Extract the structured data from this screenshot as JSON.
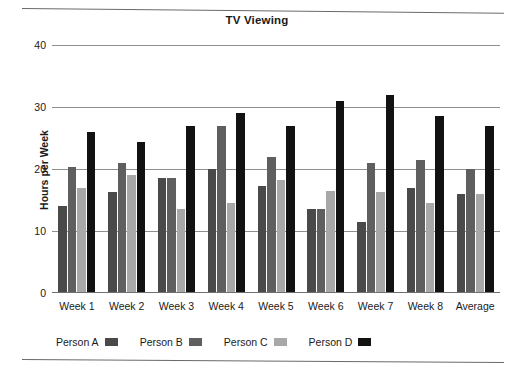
{
  "chart_data": {
    "type": "bar",
    "title": "TV Viewing",
    "xlabel": "",
    "ylabel": "Hours per Week",
    "ylim": [
      0,
      40
    ],
    "yticks": [
      0,
      10,
      20,
      30,
      40
    ],
    "grid": true,
    "legend_position": "bottom",
    "categories": [
      "Week 1",
      "Week 2",
      "Week 3",
      "Week 4",
      "Week 5",
      "Week 6",
      "Week 7",
      "Week 8",
      "Average"
    ],
    "series": [
      {
        "name": "Person A",
        "color": "#4a4a4a",
        "values": [
          14,
          16.3,
          18.5,
          20,
          17.3,
          13.5,
          11.5,
          17,
          16
        ]
      },
      {
        "name": "Person B",
        "color": "#5f5f5f",
        "values": [
          20.3,
          21,
          18.5,
          27,
          22,
          13.5,
          21,
          21.5,
          20
        ]
      },
      {
        "name": "Person C",
        "color": "#a8a8a8",
        "values": [
          17,
          19,
          13.5,
          14.5,
          18.3,
          16.5,
          16.3,
          14.5,
          16
        ]
      },
      {
        "name": "Person D",
        "color": "#121212",
        "values": [
          26,
          24.3,
          27,
          29,
          27,
          31,
          32,
          28.5,
          27
        ]
      }
    ]
  }
}
